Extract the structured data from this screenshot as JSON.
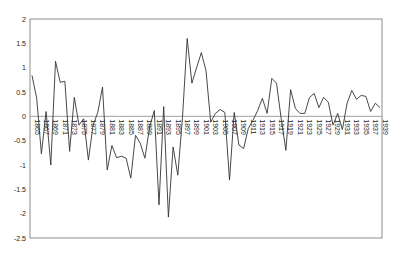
{
  "chart_data": {
    "type": "line",
    "title": "",
    "xlabel": "",
    "ylabel": "",
    "ylim": [
      -2.5,
      2
    ],
    "yticks": [
      2,
      1.5,
      1,
      0.5,
      0,
      -0.5,
      -1,
      -1.5,
      -2,
      -2.5
    ],
    "ytick_labels": [
      "2",
      "1.5",
      "1",
      "0.5",
      "0",
      "-0.5",
      "-1",
      "-1.5",
      "-2",
      "-2.5"
    ],
    "grid": false,
    "legend": null,
    "x_start": 1865,
    "x_end": 1939,
    "x_label_step": 2,
    "series": [
      {
        "name": "series1",
        "color": "#333333",
        "x": [
          1865,
          1866,
          1867,
          1868,
          1869,
          1870,
          1871,
          1872,
          1873,
          1874,
          1875,
          1876,
          1877,
          1878,
          1879,
          1880,
          1881,
          1882,
          1883,
          1884,
          1885,
          1886,
          1887,
          1888,
          1889,
          1890,
          1891,
          1892,
          1893,
          1894,
          1895,
          1896,
          1897,
          1898,
          1899,
          1900,
          1901,
          1902,
          1903,
          1904,
          1905,
          1906,
          1907,
          1908,
          1909,
          1910,
          1911,
          1912,
          1913,
          1914,
          1915,
          1916,
          1917,
          1918,
          1919,
          1920,
          1921,
          1922,
          1923,
          1924,
          1925,
          1926,
          1927,
          1928,
          1929,
          1930,
          1931,
          1932,
          1933,
          1934,
          1935,
          1936,
          1937,
          1938,
          1939
        ],
        "values": [
          0.84,
          0.37,
          -0.77,
          0.1,
          -1.0,
          1.13,
          0.7,
          0.72,
          -0.72,
          0.39,
          -0.18,
          -0.05,
          -0.9,
          -0.18,
          0.08,
          0.6,
          -1.1,
          -0.6,
          -0.85,
          -0.82,
          -0.86,
          -1.27,
          -0.39,
          -0.55,
          -0.86,
          -0.22,
          0.12,
          -1.82,
          0.2,
          -2.07,
          -0.63,
          -1.21,
          -0.02,
          1.6,
          0.68,
          1.0,
          1.31,
          0.94,
          -0.12,
          0.06,
          0.14,
          0.08,
          -1.31,
          0.08,
          -0.59,
          -0.66,
          -0.25,
          -0.08,
          0.12,
          0.37,
          0.06,
          0.78,
          0.68,
          -0.05,
          -0.7,
          0.55,
          0.16,
          0.06,
          0.06,
          0.39,
          0.47,
          0.18,
          0.39,
          0.29,
          -0.18,
          0.06,
          -0.27,
          0.27,
          0.53,
          0.35,
          0.43,
          0.41,
          0.1,
          0.27,
          0.18
        ]
      }
    ]
  }
}
